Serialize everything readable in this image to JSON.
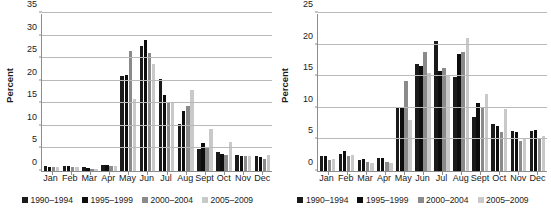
{
  "series_colors": [
    "#1a1a1a",
    "#0d0d0d",
    "#8a8a8a",
    "#c9c9c9"
  ],
  "legend": {
    "items": [
      {
        "label": "1990–1994",
        "color": "#1a1a1a"
      },
      {
        "label": "1995–1999",
        "color": "#0d0d0d"
      },
      {
        "label": "2000–2004",
        "color": "#8a8a8a"
      },
      {
        "label": "2005–2009",
        "color": "#c9c9c9"
      }
    ]
  },
  "chart_data": [
    {
      "type": "bar",
      "panel": "left",
      "title": "",
      "xlabel": "",
      "ylabel": "Percent",
      "ylim": [
        0,
        35
      ],
      "yticks": [
        0,
        5,
        10,
        15,
        20,
        25,
        30,
        35
      ],
      "grid": true,
      "legend_position": "bottom",
      "categories": [
        "Jan",
        "Feb",
        "Mar",
        "Apr",
        "May",
        "Jun",
        "Jul",
        "Aug",
        "Sept",
        "Oct",
        "Nov",
        "Dec"
      ],
      "series": [
        {
          "name": "1990–1994",
          "values": [
            1.1,
            1.2,
            0.8,
            1.4,
            21.1,
            27.7,
            20.4,
            10.4,
            4.8,
            4.3,
            3.6,
            3.3
          ]
        },
        {
          "name": "1995–1999",
          "values": [
            1.0,
            1.1,
            0.7,
            1.3,
            21.2,
            29.0,
            16.8,
            13.2,
            6.1,
            3.8,
            3.4,
            3.1
          ]
        },
        {
          "name": "2000–2004",
          "values": [
            0.8,
            1.0,
            0.5,
            1.1,
            26.6,
            26.2,
            15.2,
            14.5,
            5.4,
            3.6,
            3.3,
            2.7
          ]
        },
        {
          "name": "2005–2009",
          "values": [
            0.8,
            0.9,
            0.5,
            1.1,
            16.0,
            23.7,
            15.0,
            18.0,
            9.2,
            6.5,
            3.4,
            3.5
          ]
        }
      ]
    },
    {
      "type": "bar",
      "panel": "right",
      "title": "",
      "xlabel": "",
      "ylabel": "Percent",
      "ylim": [
        0,
        25
      ],
      "yticks": [
        0,
        5,
        10,
        15,
        20,
        25
      ],
      "grid": true,
      "legend_position": "bottom",
      "categories": [
        "Jan",
        "Feb",
        "Mar",
        "Apr",
        "May",
        "Jun",
        "Jul",
        "Aug",
        "Sept",
        "Oct",
        "Nov",
        "Dec"
      ],
      "series": [
        {
          "name": "1990–1994",
          "values": [
            2.4,
            2.7,
            1.8,
            2.1,
            10.1,
            17.0,
            20.5,
            14.8,
            8.6,
            7.5,
            6.4,
            6.4
          ]
        },
        {
          "name": "1995–1999",
          "values": [
            2.3,
            3.2,
            1.9,
            2.1,
            10.2,
            16.6,
            15.8,
            18.5,
            10.7,
            7.1,
            6.2,
            6.5
          ]
        },
        {
          "name": "2000–2004",
          "values": [
            1.7,
            2.4,
            1.4,
            1.5,
            14.2,
            18.9,
            16.3,
            18.9,
            10.2,
            6.1,
            4.8,
            5.0
          ]
        },
        {
          "name": "2005–2009",
          "values": [
            1.9,
            2.5,
            1.3,
            1.2,
            8.0,
            15.5,
            15.1,
            21.1,
            12.2,
            9.8,
            5.2,
            5.5
          ]
        }
      ]
    }
  ]
}
